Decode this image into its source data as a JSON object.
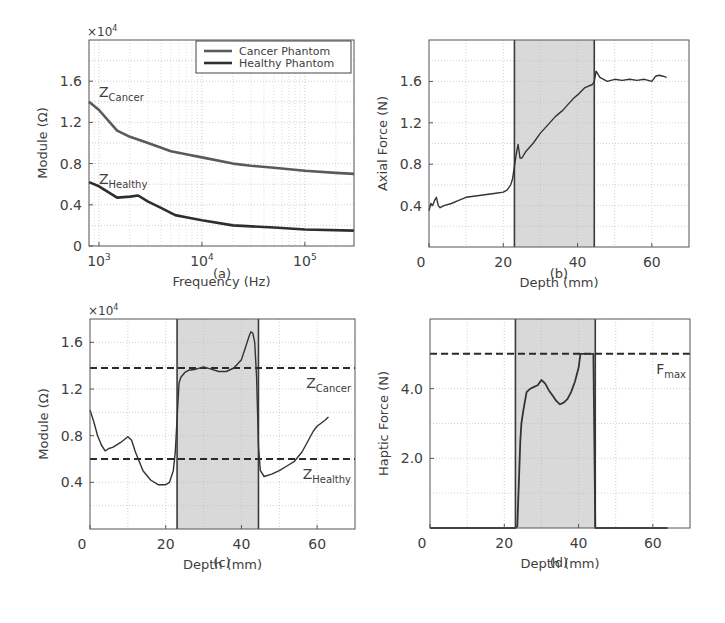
{
  "figure": {
    "panels": [
      "(a)",
      "(b)",
      "(c)",
      "(d)"
    ]
  },
  "colors": {
    "axes": "#555555",
    "grid": "#bbbbbb",
    "shade": "#d9d9d9",
    "shade_edge": "#3a3a3a",
    "cancer_line": "#5a5a5a",
    "healthy_line": "#2e2e2e",
    "trace": "#333333",
    "dashed": "#2a2a2a"
  },
  "chart_data": [
    {
      "id": "a",
      "type": "line",
      "caption": "(a)",
      "title": "",
      "xlabel": "Frequency (Hz)",
      "ylabel": "Module (Ω)",
      "y_multiplier": "×10^4",
      "xscale": "log",
      "xlim": [
        800,
        300000
      ],
      "ylim": [
        0,
        2.0
      ],
      "xticks": [
        1000,
        10000,
        100000
      ],
      "xtick_labels": [
        "10^3",
        "10^4",
        "10^5"
      ],
      "yticks": [
        0,
        0.4,
        0.8,
        1.2,
        1.6
      ],
      "ytick_labels": [
        "0",
        "0.4",
        "0.8",
        "1.2",
        "1.6"
      ],
      "grid": true,
      "legend": {
        "position": "upper right",
        "entries": [
          "Cancer Phantom",
          "Healthy Phantom"
        ]
      },
      "annotations": [
        {
          "text": "Z",
          "sub": "Cancer",
          "x": 1000,
          "y": 1.45
        },
        {
          "text": "Z",
          "sub": "Healthy",
          "x": 1000,
          "y": 0.6
        }
      ],
      "series": [
        {
          "name": "Cancer Phantom",
          "x": [
            800,
            1000,
            1500,
            2000,
            3000,
            5000,
            7000,
            10000,
            20000,
            30000,
            50000,
            100000,
            200000,
            300000
          ],
          "values": [
            1.4,
            1.32,
            1.12,
            1.06,
            1.0,
            0.92,
            0.89,
            0.86,
            0.8,
            0.78,
            0.76,
            0.73,
            0.71,
            0.7
          ]
        },
        {
          "name": "Healthy Phantom",
          "x": [
            800,
            1000,
            1500,
            2000,
            2400,
            3000,
            4000,
            5500,
            7000,
            10000,
            20000,
            50000,
            100000,
            300000
          ],
          "values": [
            0.62,
            0.58,
            0.47,
            0.48,
            0.49,
            0.43,
            0.37,
            0.3,
            0.28,
            0.25,
            0.2,
            0.18,
            0.16,
            0.15
          ]
        }
      ]
    },
    {
      "id": "b",
      "type": "line",
      "caption": "(b)",
      "title": "",
      "xlabel": "Depth (mm)",
      "ylabel": "Axial Force (N)",
      "xlim": [
        0,
        70
      ],
      "ylim": [
        0,
        2.0
      ],
      "xticks": [
        0,
        20,
        40,
        60
      ],
      "xtick_labels": [
        "0",
        "20",
        "40",
        "60"
      ],
      "yticks": [
        0.4,
        0.8,
        1.2,
        1.6
      ],
      "ytick_labels": [
        "0.4",
        "0.8",
        "1.2",
        "1.6"
      ],
      "grid": true,
      "shaded_region": [
        23,
        44.5
      ],
      "series": [
        {
          "name": "Axial Force",
          "x": [
            0,
            0.5,
            1,
            1.5,
            2,
            2.5,
            3,
            4,
            6,
            8,
            10,
            12,
            14,
            16,
            18,
            20,
            21,
            22,
            22.5,
            23,
            23.5,
            24,
            24.5,
            25,
            26,
            28,
            30,
            32,
            34,
            36,
            38,
            39,
            40,
            42,
            44,
            44.5,
            45,
            46,
            48,
            50,
            52,
            54,
            56,
            58,
            60,
            61,
            62,
            63,
            64
          ],
          "values": [
            0.35,
            0.42,
            0.4,
            0.45,
            0.48,
            0.4,
            0.38,
            0.4,
            0.42,
            0.45,
            0.48,
            0.49,
            0.5,
            0.51,
            0.52,
            0.53,
            0.55,
            0.6,
            0.66,
            0.78,
            0.9,
            0.99,
            0.86,
            0.86,
            0.92,
            1.0,
            1.1,
            1.18,
            1.26,
            1.32,
            1.4,
            1.44,
            1.47,
            1.54,
            1.57,
            1.6,
            1.7,
            1.64,
            1.6,
            1.62,
            1.61,
            1.62,
            1.61,
            1.62,
            1.6,
            1.65,
            1.66,
            1.65,
            1.64
          ]
        }
      ]
    },
    {
      "id": "c",
      "type": "line",
      "caption": "(c)",
      "title": "",
      "xlabel": "Depth (mm)",
      "ylabel": "Module (Ω)",
      "y_multiplier": "×10^4",
      "xlim": [
        0,
        70
      ],
      "ylim": [
        0,
        1.8
      ],
      "xticks": [
        0,
        20,
        40,
        60
      ],
      "xtick_labels": [
        "0",
        "20",
        "40",
        "60"
      ],
      "yticks": [
        0.4,
        0.8,
        1.2,
        1.6
      ],
      "ytick_labels": [
        "0.4",
        "0.8",
        "1.2",
        "1.6"
      ],
      "grid": true,
      "shaded_region": [
        23,
        44.5
      ],
      "reference_lines": [
        {
          "label": "Z",
          "sub": "Cancer",
          "y": 1.38
        },
        {
          "label": "Z",
          "sub": "Healthy",
          "y": 0.6
        }
      ],
      "series": [
        {
          "name": "Module",
          "x": [
            0,
            1,
            2,
            3,
            4,
            5,
            6,
            8,
            10,
            11,
            12,
            14,
            16,
            18,
            20,
            21,
            22,
            22.5,
            23,
            23.5,
            24,
            25,
            26,
            28,
            30,
            32,
            34,
            36,
            38,
            40,
            41,
            42,
            42.5,
            43,
            43.5,
            44,
            44.5,
            45,
            46,
            48,
            50,
            52,
            54,
            56,
            58,
            59,
            60,
            62,
            63
          ],
          "values": [
            1.02,
            0.92,
            0.8,
            0.72,
            0.67,
            0.69,
            0.7,
            0.74,
            0.79,
            0.76,
            0.66,
            0.5,
            0.42,
            0.38,
            0.38,
            0.4,
            0.5,
            0.65,
            0.95,
            1.25,
            1.3,
            1.34,
            1.36,
            1.37,
            1.39,
            1.37,
            1.35,
            1.35,
            1.38,
            1.45,
            1.55,
            1.65,
            1.69,
            1.68,
            1.6,
            1.3,
            0.7,
            0.5,
            0.45,
            0.47,
            0.5,
            0.54,
            0.58,
            0.66,
            0.78,
            0.84,
            0.88,
            0.93,
            0.96
          ]
        }
      ]
    },
    {
      "id": "d",
      "type": "line",
      "caption": "(d)",
      "title": "",
      "xlabel": "Depth (mm)",
      "ylabel": "Haptic Force (N)",
      "xlim": [
        0,
        70
      ],
      "ylim": [
        0,
        6.0
      ],
      "xticks": [
        0,
        20,
        40,
        60
      ],
      "xtick_labels": [
        "0",
        "20",
        "40",
        "60"
      ],
      "yticks": [
        2.0,
        4.0
      ],
      "ytick_labels": [
        "2.0",
        "4.0"
      ],
      "grid": true,
      "shaded_region": [
        23,
        44.5
      ],
      "reference_lines": [
        {
          "label": "F",
          "sub": "max",
          "y": 5.0
        }
      ],
      "series": [
        {
          "name": "Haptic Force",
          "x": [
            0,
            22,
            23,
            23.5,
            24,
            24.3,
            24.6,
            25,
            25.5,
            26,
            27,
            28,
            29,
            30,
            31,
            32,
            33,
            34,
            35,
            36,
            37,
            38,
            39,
            40,
            40.5,
            41,
            42,
            43,
            44,
            44.5,
            45,
            50,
            60,
            64
          ],
          "values": [
            0,
            0,
            0,
            0.05,
            1.5,
            2.5,
            3.0,
            3.3,
            3.6,
            3.9,
            4.0,
            4.05,
            4.1,
            4.25,
            4.15,
            3.95,
            3.8,
            3.65,
            3.55,
            3.6,
            3.7,
            3.9,
            4.2,
            4.6,
            5.0,
            5.0,
            5.0,
            5.0,
            5.0,
            0,
            0,
            0,
            0,
            0
          ]
        }
      ]
    }
  ]
}
